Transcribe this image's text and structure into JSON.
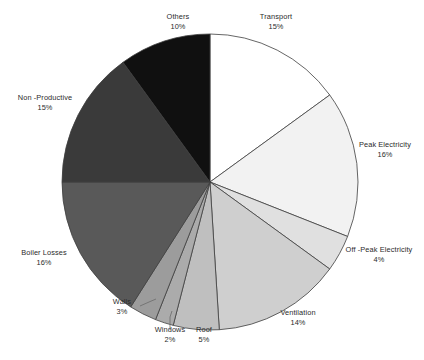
{
  "chart_data": {
    "type": "pie",
    "title": "",
    "subtitle": "",
    "xlabel": "",
    "ylabel": "",
    "legend_position": "none",
    "grid": false,
    "units": "percent",
    "start_angle_deg": 0,
    "direction": "clockwise",
    "categories": [
      "Transport",
      "Peak Electricity",
      "Off -Peak Electricity",
      "Ventilation",
      "Roof",
      "Windows",
      "Walls",
      "Boiler Losses",
      "Non -Productive",
      "Others"
    ],
    "values": [
      15,
      16,
      4,
      14,
      5,
      2,
      3,
      16,
      15,
      10
    ],
    "value_labels": [
      "15%",
      "16%",
      "4%",
      "14%",
      "5%",
      "2%",
      "3%",
      "16%",
      "15%",
      "10%"
    ],
    "colors": [
      "#ffffff",
      "#f2f2f2",
      "#e0e0e0",
      "#cfcfcf",
      "#bfbfbf",
      "#ababab",
      "#9c9c9c",
      "#595959",
      "#3a3a3a",
      "#101010"
    ],
    "slices": [
      {
        "label": "Transport",
        "value": 15,
        "value_label": "15%",
        "color": "#ffffff"
      },
      {
        "label": "Peak Electricity",
        "value": 16,
        "value_label": "16%",
        "color": "#f2f2f2"
      },
      {
        "label": "Off -Peak Electricity",
        "value": 4,
        "value_label": "4%",
        "color": "#e0e0e0"
      },
      {
        "label": "Ventilation",
        "value": 14,
        "value_label": "14%",
        "color": "#cfcfcf"
      },
      {
        "label": "Roof",
        "value": 5,
        "value_label": "5%",
        "color": "#bfbfbf"
      },
      {
        "label": "Windows",
        "value": 2,
        "value_label": "2%",
        "color": "#ababab"
      },
      {
        "label": "Walls",
        "value": 3,
        "value_label": "3%",
        "color": "#9c9c9c"
      },
      {
        "label": "Boiler Losses",
        "value": 16,
        "value_label": "16%",
        "color": "#595959"
      },
      {
        "label": "Non -Productive",
        "value": 15,
        "value_label": "15%",
        "color": "#3a3a3a"
      },
      {
        "label": "Others",
        "value": 10,
        "value_label": "10%",
        "color": "#101010"
      }
    ]
  },
  "labels": {
    "transport": {
      "name": "Transport",
      "pct": "15%"
    },
    "peak": {
      "name": "Peak Electricity",
      "pct": "16%"
    },
    "offpeak": {
      "name": "Off -Peak Electricity",
      "pct": "4%"
    },
    "ventilation": {
      "name": "Ventilation",
      "pct": "14%"
    },
    "roof": {
      "name": "Roof",
      "pct": "5%"
    },
    "windows": {
      "name": "Windows",
      "pct": "2%"
    },
    "walls": {
      "name": "Walls",
      "pct": "3%"
    },
    "boiler": {
      "name": "Boiler Losses",
      "pct": "16%"
    },
    "nonproductive": {
      "name": "Non -Productive",
      "pct": "15%"
    },
    "others": {
      "name": "Others",
      "pct": "10%"
    }
  }
}
